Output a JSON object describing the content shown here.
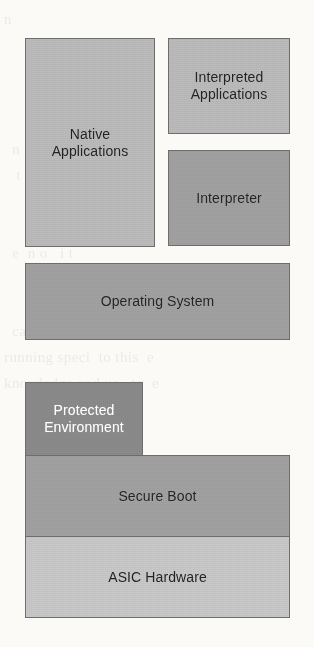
{
  "figure": {
    "kind": "layered-architecture-stack",
    "background_color": "#fbfaf7",
    "ghost_text": "n\n\n        d     l   n  o  e\n\n\n  n   o   e  r  a\n   t       s i n  t a   d\n\n\n  e  n o   i t\n\n\n  cannot be accessed by the\nrunning speci  to this  e\nknowledge and us   to  e\n\n\n               in"
  },
  "layers": [
    {
      "id": "native-applications",
      "label": "Native\nApplications",
      "label_line1": "Native",
      "label_line2": "Applications",
      "tone": "tone-light",
      "fill": "#bcbcbc",
      "text_color": "#232323"
    },
    {
      "id": "interpreted-applications",
      "label": "Interpreted\nApplications",
      "label_line1": "Interpreted",
      "label_line2": "Applications",
      "tone": "tone-light",
      "fill": "#bcbcbc",
      "text_color": "#232323"
    },
    {
      "id": "interpreter",
      "label": "Interpreter",
      "label_line1": "Interpreter",
      "label_line2": "",
      "tone": "tone-medium",
      "fill": "#a2a2a2",
      "text_color": "#232323"
    },
    {
      "id": "operating-system",
      "label": "Operating System",
      "label_line1": "Operating System",
      "label_line2": "",
      "tone": "tone-medium",
      "fill": "#a2a2a2",
      "text_color": "#232323"
    },
    {
      "id": "protected-environment",
      "label": "Protected\nEnvironment",
      "label_line1": "Protected",
      "label_line2": "Environment",
      "tone": "tone-dark",
      "fill": "#8b8b8b",
      "text_color": "#ffffff"
    },
    {
      "id": "secure-boot",
      "label": "Secure Boot",
      "label_line1": "Secure Boot",
      "label_line2": "",
      "tone": "tone-medium",
      "fill": "#a2a2a2",
      "text_color": "#232323"
    },
    {
      "id": "asic-hardware",
      "label": "ASIC Hardware",
      "label_line1": "ASIC Hardware",
      "label_line2": "",
      "tone": "tone-pale",
      "fill": "#c9c9c9",
      "text_color": "#232323"
    }
  ]
}
